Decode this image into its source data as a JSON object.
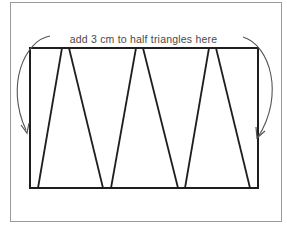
{
  "diagram": {
    "caption": "add 3 cm to half triangles here",
    "colors": {
      "frame": "#9a9a9a",
      "rectangle": "#1e1e1e",
      "lines": "#1e1e1e",
      "arrows": "#555555",
      "text": "#4a4a4a",
      "background": "#ffffff"
    },
    "frame": {
      "x": 10,
      "y": 2,
      "width": 271,
      "height": 219
    },
    "rectangle": {
      "x": 30,
      "y": 48,
      "width": 228,
      "height": 140
    },
    "zigzag_lines": [
      {
        "x1": 38,
        "y1": 188,
        "x2": 62,
        "y2": 48
      },
      {
        "x1": 69,
        "y1": 48,
        "x2": 103,
        "y2": 188
      },
      {
        "x1": 111,
        "y1": 188,
        "x2": 136,
        "y2": 48
      },
      {
        "x1": 143,
        "y1": 48,
        "x2": 178,
        "y2": 188
      },
      {
        "x1": 185,
        "y1": 188,
        "x2": 209,
        "y2": 48
      },
      {
        "x1": 216,
        "y1": 48,
        "x2": 250,
        "y2": 188
      }
    ],
    "arrows": {
      "left": {
        "path": "M 50 36 C 25 40, 5 85, 26 130",
        "head": "M 21 125 L 27 133 L 29 123"
      },
      "right": {
        "path": "M 243 37 C 270 45, 285 95, 258 137",
        "head": "M 256 127 L 257 138 L 265 131"
      }
    }
  }
}
